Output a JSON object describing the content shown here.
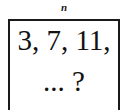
{
  "header": {
    "label": "n"
  },
  "box": {
    "line1": "3, 7, 11,",
    "line2": "... ?"
  },
  "colors": {
    "border": "#1a1a1a",
    "text": "#111111",
    "background": "#ffffff"
  }
}
